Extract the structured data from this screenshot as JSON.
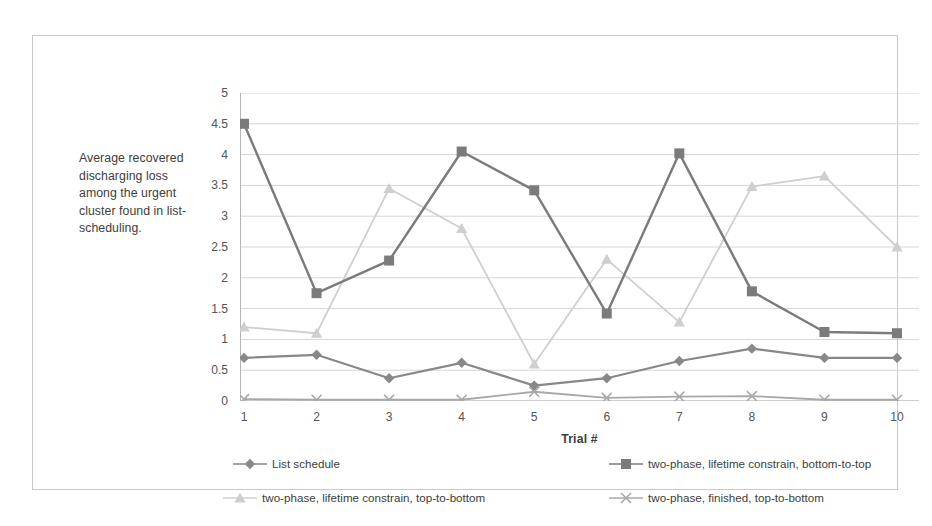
{
  "chart_data": {
    "type": "line",
    "title": "",
    "ylabel": "Average recovered discharging loss among the urgent cluster found in list-scheduling.",
    "xlabel": "Trial #",
    "categories": [
      "1",
      "2",
      "3",
      "4",
      "5",
      "6",
      "7",
      "8",
      "9",
      "10"
    ],
    "x": [
      1,
      2,
      3,
      4,
      5,
      6,
      7,
      8,
      9,
      10
    ],
    "ylim": [
      0,
      5
    ],
    "xlim": [
      1,
      10
    ],
    "y_ticks": [
      "0",
      "0.5",
      "1",
      "1.5",
      "2",
      "2.5",
      "3",
      "3.5",
      "4",
      "4.5",
      "5"
    ],
    "y_tick_values": [
      0,
      0.5,
      1,
      1.5,
      2,
      2.5,
      3,
      3.5,
      4,
      4.5,
      5
    ],
    "grid": "horizontal",
    "legend_position": "bottom",
    "series": [
      {
        "name": "List schedule",
        "marker": "diamond",
        "color": "#888888",
        "values": [
          0.7,
          0.75,
          0.37,
          0.62,
          0.25,
          0.37,
          0.65,
          0.85,
          0.7,
          0.7
        ]
      },
      {
        "name": "two-phase, lifetime constrain, bottom-to-top",
        "marker": "square",
        "color": "#7b7b7b",
        "values": [
          4.5,
          1.75,
          2.28,
          4.05,
          3.42,
          1.42,
          4.02,
          1.78,
          1.12,
          1.1
        ]
      },
      {
        "name": "two-phase, lifetime constrain, top-to-bottom",
        "marker": "triangle",
        "color": "#cfcfcf",
        "values": [
          1.2,
          1.1,
          3.45,
          2.8,
          0.6,
          2.3,
          1.28,
          3.48,
          3.65,
          2.5
        ]
      },
      {
        "name": "two-phase, finished, top-to-bottom",
        "marker": "cross",
        "color": "#a8a8a8",
        "values": [
          0.03,
          0.02,
          0.02,
          0.02,
          0.15,
          0.05,
          0.07,
          0.08,
          0.02,
          0.02
        ]
      }
    ]
  },
  "axis": {
    "y_caption": "Average recovered discharging loss among the urgent cluster found in list-scheduling.",
    "x_title": "Trial #"
  },
  "colors": {
    "frame": "#c9c9c9",
    "grid": "#d6d6d6",
    "axis": "#b4b4b4",
    "text": "#3d3d3d",
    "series_1": "#888888",
    "series_2": "#7b7b7b",
    "series_3": "#cfcfcf",
    "series_4": "#a8a8a8"
  }
}
